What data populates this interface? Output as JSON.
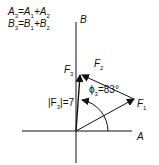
{
  "equations": [
    {
      "lhs": "A",
      "lhs_sub": "3",
      "a": "A",
      "a_sub": "1",
      "b": "A",
      "b_sub": "2"
    },
    {
      "lhs": "B",
      "lhs_sub": "3",
      "a": "B",
      "a_sub": "1",
      "b": "B",
      "b_sub": "2"
    }
  ],
  "axes": {
    "horizontal": "A",
    "vertical": "B"
  },
  "vectors": {
    "f1": {
      "name": "F",
      "sub": "1"
    },
    "f2": {
      "name": "F",
      "sub": "2"
    },
    "f3": {
      "name": "F",
      "sub": "3"
    }
  },
  "magnitude_label": {
    "prefix": "|F",
    "sub": "3",
    "suffix": "|=7"
  },
  "angle_label": {
    "symbol": "ϕ",
    "sub": "3",
    "value": "=83°"
  },
  "colors": {
    "line": "#111111",
    "background": "#ffffff"
  }
}
